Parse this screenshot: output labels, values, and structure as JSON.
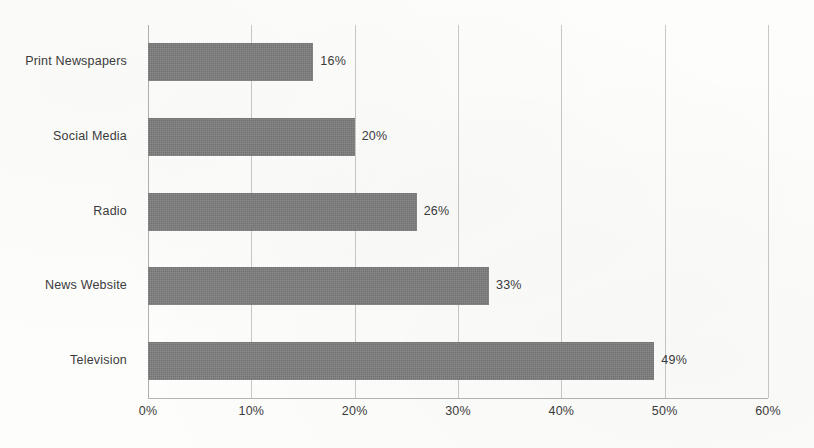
{
  "chart_data": {
    "type": "bar",
    "orientation": "horizontal",
    "title": "",
    "subtitle": "",
    "xlabel": "",
    "ylabel": "",
    "categories": [
      "Television",
      "News Website",
      "Radio",
      "Social Media",
      "Print Newspapers"
    ],
    "values": [
      49,
      33,
      26,
      20,
      16
    ],
    "data_labels": [
      "49%",
      "33%",
      "26%",
      "20%",
      "16%"
    ],
    "display_order_top_to_bottom": [
      "Print Newspapers",
      "Social Media",
      "Radio",
      "News Website",
      "Television"
    ],
    "xlim": [
      0,
      60
    ],
    "x_tick_values": [
      0,
      10,
      20,
      30,
      40,
      50,
      60
    ],
    "x_tick_labels": [
      "0%",
      "10%",
      "20%",
      "30%",
      "40%",
      "50%",
      "60%"
    ],
    "grid": true,
    "grid_axis": "x",
    "legend": false,
    "legend_position": "none",
    "series": [
      {
        "name": "",
        "values": [
          16,
          20,
          26,
          33,
          49
        ]
      }
    ],
    "colors": {
      "bar": "#7f7f7f",
      "text": "#3b3b3b",
      "gridline": "#c8c8c6",
      "axis": "#b4b4b2",
      "background": "#fdfdfc"
    }
  },
  "bars": [
    {
      "category": "Print Newspapers",
      "value": 16,
      "label": "16%"
    },
    {
      "category": "Social Media",
      "value": 20,
      "label": "20%"
    },
    {
      "category": "Radio",
      "value": 26,
      "label": "26%"
    },
    {
      "category": "News Website",
      "value": 33,
      "label": "33%"
    },
    {
      "category": "Television",
      "value": 49,
      "label": "49%"
    }
  ],
  "x_axis": {
    "ticks": [
      {
        "value": 0,
        "label": "0%"
      },
      {
        "value": 10,
        "label": "10%"
      },
      {
        "value": 20,
        "label": "20%"
      },
      {
        "value": 30,
        "label": "30%"
      },
      {
        "value": 40,
        "label": "40%"
      },
      {
        "value": 50,
        "label": "50%"
      },
      {
        "value": 60,
        "label": "60%"
      }
    ]
  }
}
